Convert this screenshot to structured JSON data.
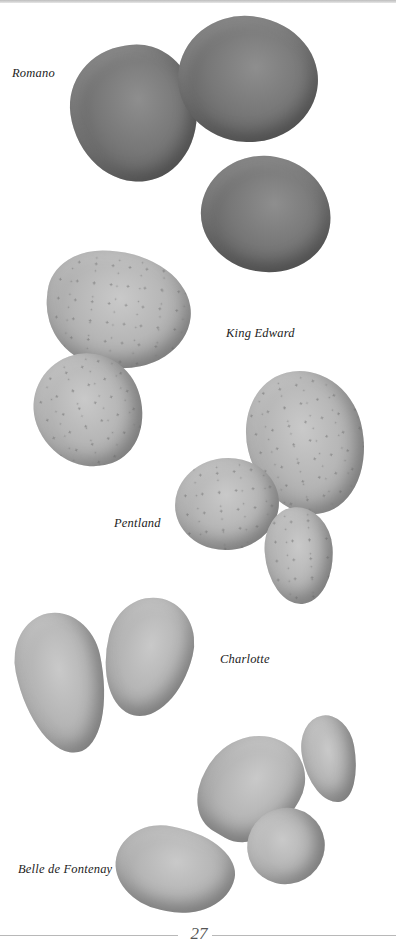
{
  "page": {
    "number": "27",
    "varieties": [
      {
        "name": "Romano",
        "tone": "dark",
        "count": 3
      },
      {
        "name": "King Edward",
        "tone": "light",
        "count": 2
      },
      {
        "name": "Pentland",
        "tone": "light",
        "count": 3
      },
      {
        "name": "Charlotte",
        "tone": "light",
        "count": 2
      },
      {
        "name": "Belle de Fontenay",
        "tone": "light",
        "count": 4
      }
    ]
  },
  "colors": {
    "background": "#ffffff",
    "caption_text": "#1c1c1c",
    "page_number": "#555555",
    "rule": "#b8b8b8"
  }
}
